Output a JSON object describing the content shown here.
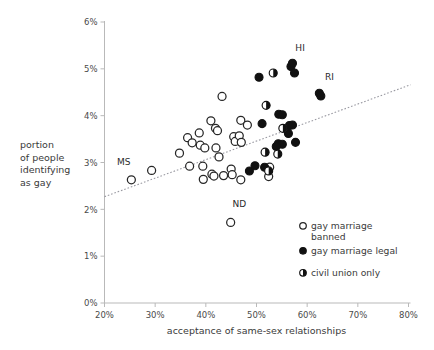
{
  "chart_data": {
    "type": "scatter",
    "title": "",
    "xlabel": "acceptance of same-sex relationships",
    "ylabel": "portion of people identifying as gay",
    "ylabel_lines": [
      "portion",
      "of people",
      "identifying",
      "as gay"
    ],
    "xlim": [
      20,
      80
    ],
    "ylim": [
      0,
      6
    ],
    "xticks": [
      "20%",
      "30%",
      "40%",
      "50%",
      "60%",
      "70%",
      "80%"
    ],
    "xtick_values": [
      20,
      30,
      40,
      50,
      60,
      70,
      80
    ],
    "yticks": [
      "0%",
      "1%",
      "2%",
      "3%",
      "4%",
      "5%",
      "6%"
    ],
    "ytick_values": [
      0,
      1,
      2,
      3,
      4,
      5,
      6
    ],
    "grid": false,
    "legend_position": "bottom-right",
    "trendline": {
      "x0": 20,
      "y0": 2.27,
      "x1": 80.4,
      "y1": 4.66,
      "style": "dotted"
    },
    "series": [
      {
        "name": "gay marriage banned",
        "marker": "open-circle",
        "color": "#ffffff",
        "edge": "#262626",
        "points": [
          {
            "x": 25.3,
            "y": 2.63,
            "label": "MS"
          },
          {
            "x": 29.3,
            "y": 2.83,
            "label": ""
          },
          {
            "x": 34.8,
            "y": 3.2,
            "label": ""
          },
          {
            "x": 36.4,
            "y": 3.53,
            "label": ""
          },
          {
            "x": 37.3,
            "y": 3.42,
            "label": ""
          },
          {
            "x": 36.8,
            "y": 2.92,
            "label": ""
          },
          {
            "x": 38.7,
            "y": 3.63,
            "label": ""
          },
          {
            "x": 38.9,
            "y": 3.37,
            "label": ""
          },
          {
            "x": 39.8,
            "y": 3.31,
            "label": ""
          },
          {
            "x": 39.4,
            "y": 2.92,
            "label": ""
          },
          {
            "x": 39.5,
            "y": 2.64,
            "label": ""
          },
          {
            "x": 41.0,
            "y": 3.89,
            "label": ""
          },
          {
            "x": 41.9,
            "y": 3.73,
            "label": ""
          },
          {
            "x": 42.3,
            "y": 3.68,
            "label": ""
          },
          {
            "x": 42.0,
            "y": 3.31,
            "label": ""
          },
          {
            "x": 42.6,
            "y": 3.12,
            "label": ""
          },
          {
            "x": 41.2,
            "y": 2.75,
            "label": ""
          },
          {
            "x": 41.6,
            "y": 2.71,
            "label": ""
          },
          {
            "x": 43.2,
            "y": 4.41,
            "label": ""
          },
          {
            "x": 43.5,
            "y": 2.72,
            "label": ""
          },
          {
            "x": 44.9,
            "y": 1.72,
            "label": "ND"
          },
          {
            "x": 45.5,
            "y": 3.55,
            "label": ""
          },
          {
            "x": 45.8,
            "y": 3.45,
            "label": ""
          },
          {
            "x": 45.0,
            "y": 2.86,
            "label": ""
          },
          {
            "x": 45.2,
            "y": 2.74,
            "label": ""
          },
          {
            "x": 46.9,
            "y": 3.9,
            "label": ""
          },
          {
            "x": 46.6,
            "y": 3.57,
            "label": ""
          },
          {
            "x": 47.0,
            "y": 3.43,
            "label": ""
          },
          {
            "x": 46.9,
            "y": 2.63,
            "label": ""
          },
          {
            "x": 48.2,
            "y": 3.8,
            "label": ""
          },
          {
            "x": 52.6,
            "y": 2.9,
            "label": ""
          },
          {
            "x": 52.4,
            "y": 2.7,
            "label": ""
          }
        ]
      },
      {
        "name": "gay marriage legal",
        "marker": "filled-circle",
        "color": "#111111",
        "edge": "#111111",
        "points": [
          {
            "x": 48.6,
            "y": 2.82,
            "label": ""
          },
          {
            "x": 50.5,
            "y": 4.82,
            "label": ""
          },
          {
            "x": 49.7,
            "y": 2.93,
            "label": ""
          },
          {
            "x": 51.1,
            "y": 3.83,
            "label": ""
          },
          {
            "x": 51.6,
            "y": 2.9,
            "label": ""
          },
          {
            "x": 54.4,
            "y": 4.03,
            "label": ""
          },
          {
            "x": 55.1,
            "y": 4.02,
            "label": ""
          },
          {
            "x": 54.3,
            "y": 3.4,
            "label": ""
          },
          {
            "x": 55.1,
            "y": 3.39,
            "label": ""
          },
          {
            "x": 53.9,
            "y": 3.34,
            "label": ""
          },
          {
            "x": 56.8,
            "y": 5.05,
            "label": ""
          },
          {
            "x": 57.1,
            "y": 5.12,
            "label": ""
          },
          {
            "x": 57.5,
            "y": 4.91,
            "label": ""
          },
          {
            "x": 56.5,
            "y": 3.79,
            "label": ""
          },
          {
            "x": 57.1,
            "y": 3.8,
            "label": ""
          },
          {
            "x": 56.3,
            "y": 3.62,
            "label": ""
          },
          {
            "x": 57.7,
            "y": 3.43,
            "label": ""
          },
          {
            "x": 62.4,
            "y": 4.48,
            "label": ""
          },
          {
            "x": 62.7,
            "y": 4.42,
            "label": "RI"
          }
        ]
      },
      {
        "name": "civil union only",
        "marker": "half-circle",
        "color": "#111111",
        "edge": "#111111",
        "points": [
          {
            "x": 51.9,
            "y": 4.22,
            "label": ""
          },
          {
            "x": 53.3,
            "y": 4.91,
            "label": ""
          },
          {
            "x": 51.7,
            "y": 3.22,
            "label": ""
          },
          {
            "x": 52.4,
            "y": 2.82,
            "label": ""
          },
          {
            "x": 55.2,
            "y": 3.73,
            "label": ""
          },
          {
            "x": 54.2,
            "y": 3.18,
            "label": ""
          }
        ]
      }
    ],
    "annotations": [
      {
        "text": "HI",
        "x": 58.6,
        "y": 5.38
      },
      {
        "text": "RI",
        "x": 64.4,
        "y": 4.76
      },
      {
        "text": "MS",
        "x": 23.8,
        "y": 2.95
      },
      {
        "text": "ND",
        "x": 46.6,
        "y": 2.05
      }
    ]
  },
  "legend": {
    "items": [
      {
        "label_lines": [
          "gay marriage",
          "banned"
        ],
        "marker": "open-circle"
      },
      {
        "label_lines": [
          "gay marriage legal"
        ],
        "marker": "filled-circle"
      },
      {
        "label_lines": [
          "civil union only"
        ],
        "marker": "half-circle"
      }
    ]
  },
  "colors": {
    "axis": "#b9b9b9",
    "text": "#3a3a3a",
    "marker_dark": "#111111",
    "marker_light": "#ffffff",
    "trend": "#9a9aa2"
  }
}
